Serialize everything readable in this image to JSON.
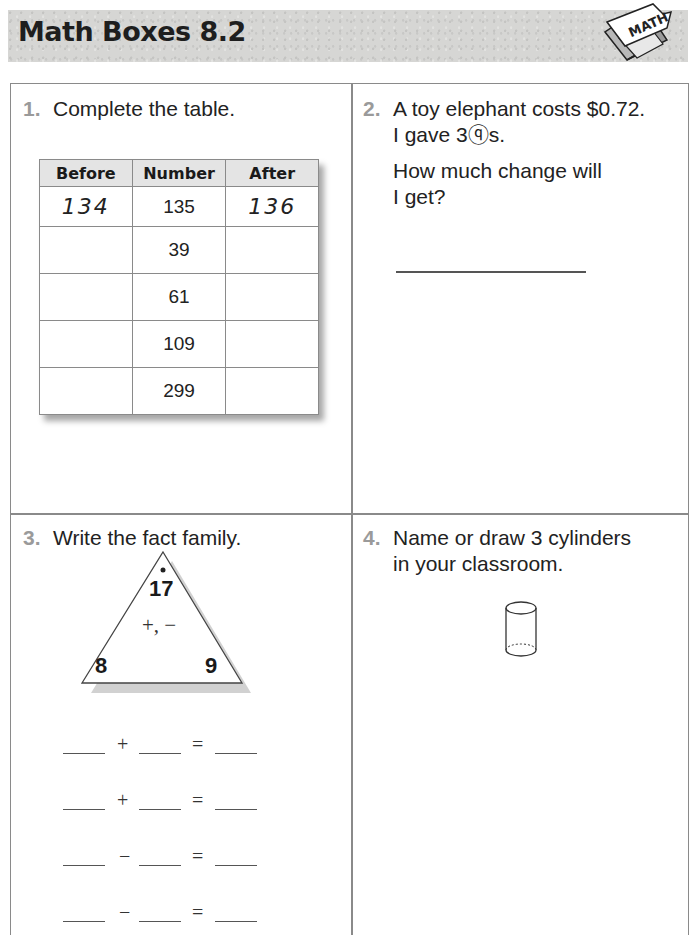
{
  "header": {
    "title": "Math Boxes 8.2",
    "logo_text": "MATH"
  },
  "problems": {
    "p1": {
      "number": "1.",
      "prompt": "Complete the table.",
      "table": {
        "headers": [
          "Before",
          "Number",
          "After"
        ],
        "rows": [
          {
            "before": "134",
            "number": "135",
            "after": "136"
          },
          {
            "before": "",
            "number": "39",
            "after": ""
          },
          {
            "before": "",
            "number": "61",
            "after": ""
          },
          {
            "before": "",
            "number": "109",
            "after": ""
          },
          {
            "before": "",
            "number": "299",
            "after": ""
          }
        ]
      }
    },
    "p2": {
      "number": "2.",
      "line1": "A toy elephant costs $0.72.",
      "line2": "I gave 3ⓠs.",
      "line3": "How much change will",
      "line4": "I get?",
      "answer": ""
    },
    "p3": {
      "number": "3.",
      "prompt": "Write the fact family.",
      "triangle": {
        "top": "17",
        "ops": "+, −",
        "left": "8",
        "right": "9"
      },
      "facts": [
        {
          "op": "+",
          "eq": "="
        },
        {
          "op": "+",
          "eq": "="
        },
        {
          "op": "−",
          "eq": "="
        },
        {
          "op": "−",
          "eq": "="
        }
      ]
    },
    "p4": {
      "number": "4.",
      "line1": "Name or draw 3 cylinders",
      "line2": "in your classroom."
    }
  },
  "colors": {
    "header_band": "#d6d6d4",
    "border": "#8a8a8a",
    "problem_number": "#9a9a9a",
    "table_header": "#e4e4e4"
  }
}
